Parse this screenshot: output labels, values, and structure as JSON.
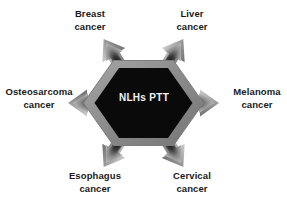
{
  "figure": {
    "background_color": "#ffffff"
  },
  "center": {
    "name": "nlhs-ptt-core",
    "line1": "NLHs",
    "line2": "PTT",
    "shape": "hexagon",
    "fill_color": "#0a0a0a",
    "border_color": "#8d8d8d",
    "text_color": "#f2f2f2"
  },
  "arrows": {
    "count": 6,
    "style": "gradient-block-arrow",
    "core_color": "#2b2b2b",
    "edge_color": "#b6b6b6"
  },
  "nodes": [
    {
      "id": "breast",
      "name": "node-breast-cancer",
      "line1": "Breast",
      "line2": "cancer",
      "direction": "up-left",
      "angle_deg": 120
    },
    {
      "id": "liver",
      "name": "node-liver-cancer",
      "line1": "Liver",
      "line2": "cancer",
      "direction": "up-right",
      "angle_deg": 60
    },
    {
      "id": "osteosarcoma",
      "name": "node-osteosarcoma-cancer",
      "line1": "Osteosarcoma",
      "line2": "cancer",
      "direction": "left",
      "angle_deg": 180
    },
    {
      "id": "melanoma",
      "name": "node-melanoma-cancer",
      "line1": "Melanoma",
      "line2": "cancer",
      "direction": "right",
      "angle_deg": 0
    },
    {
      "id": "esophagus",
      "name": "node-esophagus-cancer",
      "line1": "Esophagus",
      "line2": "cancer",
      "direction": "down-left",
      "angle_deg": 240
    },
    {
      "id": "cervical",
      "name": "node-cervical-cancer",
      "line1": "Cervical",
      "line2": "cancer",
      "direction": "down-right",
      "angle_deg": 300
    }
  ]
}
